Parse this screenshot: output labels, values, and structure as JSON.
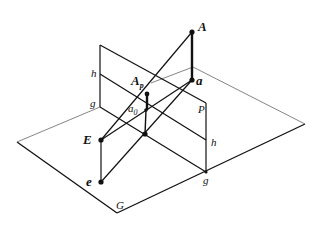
{
  "diagram": {
    "labels": {
      "A": "A",
      "a": "a",
      "Ap_main": "A",
      "Ap_sub": "p",
      "a0_main": "a",
      "a0_sub": "0",
      "E": "E",
      "e": "e",
      "h_left": "h",
      "g_left": "g",
      "h_right": "h",
      "g_right": "g",
      "P": "P",
      "G": "G"
    },
    "colors": {
      "line": "#111111",
      "thin_line": "#555555",
      "background": "#ffffff"
    }
  }
}
